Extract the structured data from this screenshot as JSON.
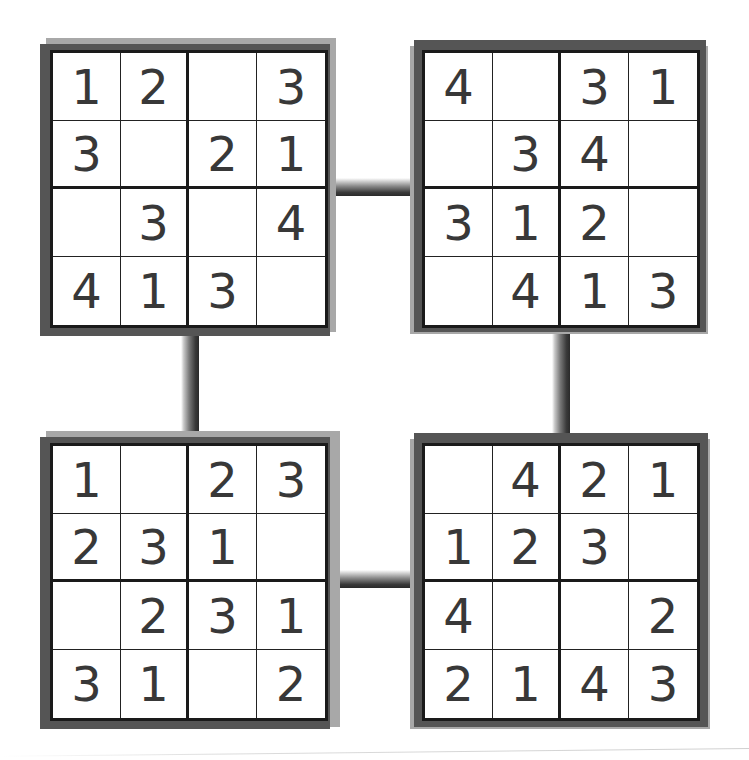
{
  "puzzle_set": {
    "grid_size": 4,
    "box_size": 2,
    "colors": {
      "digit": "#383838",
      "grid_line": "#1a1a1a",
      "frame_dark": "#555555",
      "frame_light": "#a8a8a8",
      "background": "#ffffff"
    },
    "puzzles": [
      {
        "position": "top-left",
        "cells": [
          [
            "1",
            "2",
            "",
            "3"
          ],
          [
            "3",
            "",
            "2",
            "1"
          ],
          [
            "",
            "3",
            "",
            "4"
          ],
          [
            "4",
            "1",
            "3",
            ""
          ]
        ]
      },
      {
        "position": "top-right",
        "cells": [
          [
            "4",
            "",
            "3",
            "1"
          ],
          [
            "",
            "3",
            "4",
            ""
          ],
          [
            "3",
            "1",
            "2",
            ""
          ],
          [
            "",
            "4",
            "1",
            "3"
          ]
        ]
      },
      {
        "position": "bottom-left",
        "cells": [
          [
            "1",
            "",
            "2",
            "3"
          ],
          [
            "2",
            "3",
            "1",
            ""
          ],
          [
            "",
            "2",
            "3",
            "1"
          ],
          [
            "3",
            "1",
            "",
            "2"
          ]
        ]
      },
      {
        "position": "bottom-right",
        "cells": [
          [
            "",
            "4",
            "2",
            "1"
          ],
          [
            "1",
            "2",
            "3",
            ""
          ],
          [
            "4",
            "",
            "",
            "2"
          ],
          [
            "2",
            "1",
            "4",
            "3"
          ]
        ]
      }
    ],
    "connectors": [
      {
        "name": "connector-top",
        "orientation": "horizontal",
        "between": [
          "top-left",
          "top-right"
        ]
      },
      {
        "name": "connector-left",
        "orientation": "vertical",
        "between": [
          "top-left",
          "bottom-left"
        ]
      },
      {
        "name": "connector-right",
        "orientation": "vertical",
        "between": [
          "top-right",
          "bottom-right"
        ]
      },
      {
        "name": "connector-bottom",
        "orientation": "horizontal",
        "between": [
          "bottom-left",
          "bottom-right"
        ]
      }
    ]
  }
}
